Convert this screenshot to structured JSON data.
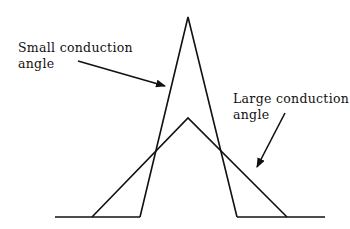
{
  "labels": {
    "small": {
      "line1": "Small conduction",
      "line2": "angle"
    },
    "large": {
      "line1": "Large conduction",
      "line2": "angle"
    }
  },
  "colors": {
    "stroke": "#111111",
    "background": "#ffffff"
  }
}
